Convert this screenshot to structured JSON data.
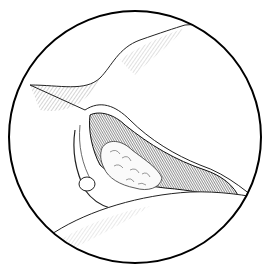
{
  "illustration": {
    "style": "pen-and-ink medical illustration in circular frame",
    "frame_color": "#000000",
    "background": "#ffffff",
    "stroke_color": "#1a1a1a"
  }
}
